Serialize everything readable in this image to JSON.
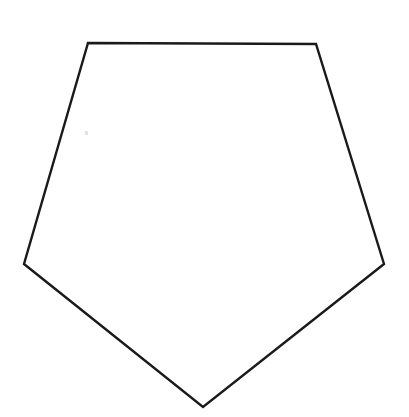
{
  "figure": {
    "canvas": {
      "width": 409,
      "height": 417,
      "background_color": "#ffffff"
    },
    "shape": {
      "name": "pentagon",
      "sides": 5,
      "fill_color": "#ffffff",
      "stroke_color": "#1a1a1a",
      "stroke_width": 2.4,
      "orientation": "point-down",
      "points": "88,43 316,44 384,264 203,407 24,264",
      "vertices": [
        {
          "label": "top-left",
          "x": 88,
          "y": 43
        },
        {
          "label": "top-right",
          "x": 316,
          "y": 44
        },
        {
          "label": "right",
          "x": 384,
          "y": 264
        },
        {
          "label": "bottom",
          "x": 203,
          "y": 407
        },
        {
          "label": "left",
          "x": 24,
          "y": 264
        }
      ],
      "edges": [
        {
          "label": "top-edge",
          "from": "top-left",
          "to": "top-right"
        },
        {
          "label": "right-upper-edge",
          "from": "top-right",
          "to": "right"
        },
        {
          "label": "right-lower-edge",
          "from": "right",
          "to": "bottom"
        },
        {
          "label": "left-lower-edge",
          "from": "bottom",
          "to": "left"
        },
        {
          "label": "left-upper-edge",
          "from": "left",
          "to": "top-left"
        }
      ]
    },
    "artifact": {
      "label": "scan-speck",
      "x": 85,
      "y": 131,
      "color": "#c9c9c9"
    }
  }
}
